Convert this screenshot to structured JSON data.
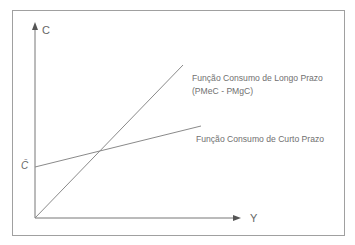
{
  "diagram": {
    "type": "consumption-function",
    "axes": {
      "y_label": "C",
      "x_label": "Y"
    },
    "intercept_label": "C̄",
    "curves": [
      {
        "name": "long-run",
        "label_line1": "Função Consumo de Longo Prazo",
        "label_line2": "(PMeC - PMgC)"
      },
      {
        "name": "short-run",
        "label_line1": "Função Consumo de Curto Prazo"
      }
    ],
    "colors": {
      "frame": "#9a9a9a",
      "axes": "#777777",
      "lines": "#8a8a8a",
      "text": "#6a6a6a"
    }
  }
}
